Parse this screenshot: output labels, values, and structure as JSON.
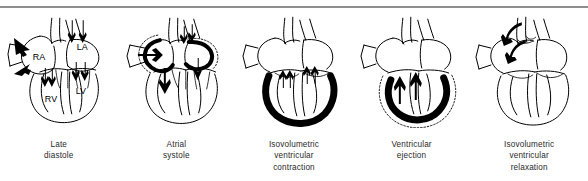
{
  "figure": {
    "background_color": "#ffffff",
    "rule_color": "#8e8e8e",
    "ink_color": "#000000",
    "caption_color": "#2a2a2a"
  },
  "chamber_labels": {
    "right_atrium": "RA",
    "left_atrium": "LA",
    "right_ventricle": "RV",
    "left_ventricle": "LV"
  },
  "panels": [
    {
      "id": "late-diastole",
      "caption_lines": [
        "Late",
        "diastole"
      ]
    },
    {
      "id": "atrial-systole",
      "caption_lines": [
        "Atrial",
        "systole"
      ]
    },
    {
      "id": "isovolumetric-ventricular-contraction",
      "caption_lines": [
        "Isovolumetric",
        "ventricular",
        "contraction"
      ]
    },
    {
      "id": "ventricular-ejection",
      "caption_lines": [
        "Ventricular",
        "ejection"
      ]
    },
    {
      "id": "isovolumetric-ventricular-relaxation",
      "caption_lines": [
        "Isovolumetric",
        "ventricular",
        "relaxation"
      ]
    }
  ]
}
